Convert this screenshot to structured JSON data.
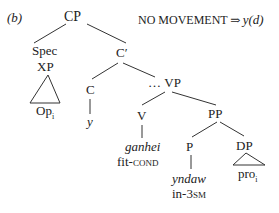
{
  "label": "(b)",
  "annotation": {
    "text": "NO MOVEMENT",
    "arrow": "⇒",
    "result": "y(d)"
  },
  "tree": {
    "root": "CP",
    "spec": "Spec",
    "xp": "XP",
    "op": "Op",
    "op_index": "i",
    "cbar": "C′",
    "c": "C",
    "c_word": "y",
    "vp": "VP",
    "vp_ellipsis": "…",
    "v": "V",
    "v_word": "ganhei",
    "v_gloss_stem": "fit-",
    "v_gloss_sc": "cond",
    "pp": "PP",
    "p": "P",
    "p_word": "yndaw",
    "p_gloss_stem": "in-3",
    "p_gloss_sc": "sm",
    "dp": "DP",
    "pro": "pro",
    "pro_index": "i"
  }
}
